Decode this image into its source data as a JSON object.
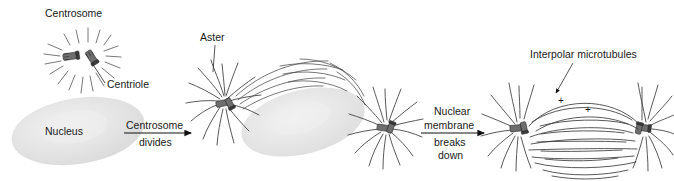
{
  "figure": {
    "background_color": "#ffffff",
    "line_color": "#3b3b3b",
    "nucleus_fill": "#e3e3e3",
    "centriole_color": "#5a5a5a"
  },
  "labels": {
    "centrosome": "Centrosome",
    "centriole": "Centriole",
    "nucleus": "Nucleus",
    "aster": "Aster",
    "interpolar_microtubules": "Interpolar microtubules",
    "plus_1": "+",
    "plus_2": "+"
  },
  "arrows": [
    {
      "name": "centrosome-divides",
      "line_above": "Centrosome",
      "line_below": "divides"
    },
    {
      "name": "nuclear-membrane-breaks-down",
      "line_above_1": "Nuclear",
      "line_above_2": "membrane",
      "line_below_1": "breaks",
      "line_below_2": "down"
    }
  ],
  "stages": [
    {
      "index": 1,
      "name": "interphase-single-centrosome",
      "parts": [
        "Centrosome",
        "Centriole",
        "Nucleus"
      ]
    },
    {
      "index": 2,
      "name": "prophase-two-asters",
      "parts": [
        "Aster",
        "Nucleus"
      ]
    },
    {
      "index": 3,
      "name": "prometaphase-spindle",
      "parts": [
        "Interpolar microtubules",
        "+",
        "+"
      ]
    }
  ]
}
